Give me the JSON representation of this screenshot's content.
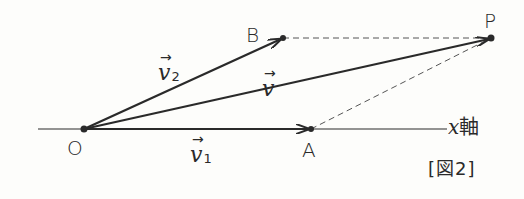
{
  "diagram": {
    "title": "[図2]",
    "axis_label": {
      "var": "x",
      "suffix": "軸"
    },
    "points": {
      "O": {
        "label": "O",
        "x": 84,
        "y": 129
      },
      "A": {
        "label": "A",
        "x": 311,
        "y": 129
      },
      "B": {
        "label": "B",
        "x": 283,
        "y": 38
      },
      "P": {
        "label": "P",
        "x": 491,
        "y": 38
      }
    },
    "vectors": [
      {
        "name": "v1",
        "symbol": "v",
        "subscript": "1",
        "from": "O",
        "to": "A"
      },
      {
        "name": "v2",
        "symbol": "v",
        "subscript": "2",
        "from": "O",
        "to": "B"
      },
      {
        "name": "v",
        "symbol": "v",
        "subscript": "",
        "from": "O",
        "to": "P"
      }
    ],
    "dashed_lines": [
      {
        "from": "B",
        "to": "P"
      },
      {
        "from": "A",
        "to": "P"
      }
    ],
    "arrow_glyph": "→",
    "colors": {
      "stroke": "#2a2a2a",
      "background": "#fdfdfb"
    }
  }
}
